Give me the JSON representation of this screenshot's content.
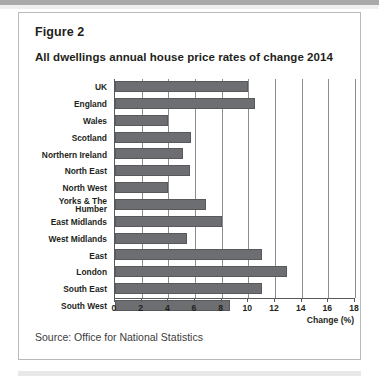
{
  "figure": {
    "label": "Figure 2",
    "title": "All dwellings annual house price rates of change 2014",
    "source": "Source: Office for National Statistics"
  },
  "colors": {
    "bar_fill": "#6d6e71",
    "bar_stroke": "#58595b",
    "gridline": "#8c8c8c",
    "axis": "#58595b",
    "text": "#231f20",
    "card_border": "#b9b9b9",
    "page_background": "#ffffff"
  },
  "chart_data": {
    "type": "bar",
    "orientation": "horizontal",
    "title": "All dwellings annual house price rates of change 2014",
    "xlabel": "Change (%)",
    "ylabel": "",
    "xlim": [
      0,
      18
    ],
    "xticks": [
      0,
      2,
      4,
      6,
      8,
      10,
      12,
      14,
      16,
      18
    ],
    "xtick_labels": [
      "0",
      "2",
      "4",
      "6",
      "8",
      "10",
      "12",
      "14",
      "16",
      "18"
    ],
    "grid": true,
    "grid_axis": "x",
    "legend": false,
    "categories": [
      "UK",
      "England",
      "Wales",
      "Scotland",
      "Northern Ireland",
      "North East",
      "North West",
      "Yorks & The Humber",
      "East Midlands",
      "West Midlands",
      "East",
      "London",
      "South East",
      "South West"
    ],
    "category_label_lines": [
      [
        "UK"
      ],
      [
        "England"
      ],
      [
        "Wales"
      ],
      [
        "Scotland"
      ],
      [
        "Northern Ireland"
      ],
      [
        "North East"
      ],
      [
        "North West"
      ],
      [
        "Yorks & The",
        "Humber"
      ],
      [
        "East Midlands"
      ],
      [
        "West Midlands"
      ],
      [
        "East"
      ],
      [
        "London"
      ],
      [
        "South East"
      ],
      [
        "South West"
      ]
    ],
    "values": [
      10.0,
      10.5,
      4.0,
      5.7,
      5.1,
      5.6,
      4.0,
      6.8,
      8.0,
      5.4,
      11.0,
      12.9,
      11.0,
      8.6
    ],
    "series": [
      {
        "name": "Annual house price rate of change 2014 (%)",
        "values": [
          10.0,
          10.5,
          4.0,
          5.7,
          5.1,
          5.6,
          4.0,
          6.8,
          8.0,
          5.4,
          11.0,
          12.9,
          11.0,
          8.6
        ]
      }
    ]
  }
}
